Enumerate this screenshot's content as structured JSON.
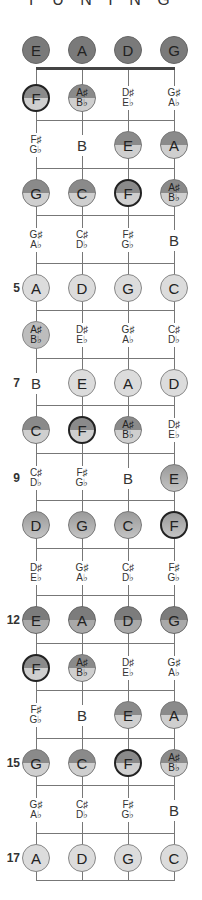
{
  "title": "T U N I N G",
  "strings_x": [
    36,
    82,
    128,
    174
  ],
  "row_y0": 50,
  "row_spacing": 47.5,
  "colors": {
    "string": "#777777",
    "nut": "#444444",
    "open": "#7a7a7a",
    "light": "#dcdcdc"
  },
  "fret_numbers": [
    {
      "fret": 5,
      "label": "5"
    },
    {
      "fret": 7,
      "label": "7"
    },
    {
      "fret": 9,
      "label": "9"
    },
    {
      "fret": 12,
      "label": "12"
    },
    {
      "fret": 15,
      "label": "15"
    },
    {
      "fret": 17,
      "label": "17"
    }
  ],
  "rows": [
    {
      "fret": 0,
      "notes": [
        {
          "n": "E",
          "style": "open"
        },
        {
          "n": "A",
          "style": "open"
        },
        {
          "n": "D",
          "style": "open"
        },
        {
          "n": "G",
          "style": "open"
        }
      ]
    },
    {
      "fret": 1,
      "notes": [
        {
          "n": "F",
          "style": "half f"
        },
        {
          "n": "A♯|B♭",
          "style": "half"
        },
        {
          "n": "D♯|E♭",
          "style": "plain"
        },
        {
          "n": "G♯|A♭",
          "style": "plain"
        }
      ]
    },
    {
      "fret": 2,
      "notes": [
        {
          "n": "F♯|G♭",
          "style": "plain"
        },
        {
          "n": "B",
          "style": "plain"
        },
        {
          "n": "E",
          "style": "half"
        },
        {
          "n": "A",
          "style": "half"
        }
      ]
    },
    {
      "fret": 3,
      "notes": [
        {
          "n": "G",
          "style": "half"
        },
        {
          "n": "C",
          "style": "half"
        },
        {
          "n": "F",
          "style": "half f"
        },
        {
          "n": "A♯|B♭",
          "style": "half"
        }
      ]
    },
    {
      "fret": 4,
      "notes": [
        {
          "n": "G♯|A♭",
          "style": "plain"
        },
        {
          "n": "C♯|D♭",
          "style": "plain"
        },
        {
          "n": "F♯|G♭",
          "style": "plain"
        },
        {
          "n": "B",
          "style": "plain"
        }
      ]
    },
    {
      "fret": 5,
      "notes": [
        {
          "n": "A",
          "style": "light"
        },
        {
          "n": "D",
          "style": "light"
        },
        {
          "n": "G",
          "style": "light"
        },
        {
          "n": "C",
          "style": "light"
        }
      ]
    },
    {
      "fret": 6,
      "notes": [
        {
          "n": "A♯|B♭",
          "style": "mid"
        },
        {
          "n": "D♯|E♭",
          "style": "plain"
        },
        {
          "n": "G♯|A♭",
          "style": "plain"
        },
        {
          "n": "C♯|D♭",
          "style": "plain"
        }
      ]
    },
    {
      "fret": 7,
      "notes": [
        {
          "n": "B",
          "style": "plain"
        },
        {
          "n": "E",
          "style": "light"
        },
        {
          "n": "A",
          "style": "light"
        },
        {
          "n": "D",
          "style": "light"
        }
      ]
    },
    {
      "fret": 8,
      "notes": [
        {
          "n": "C",
          "style": "half"
        },
        {
          "n": "F",
          "style": "half f"
        },
        {
          "n": "A♯|B♭",
          "style": "half"
        },
        {
          "n": "D♯|E♭",
          "style": "plain"
        }
      ]
    },
    {
      "fret": 9,
      "notes": [
        {
          "n": "C♯|D♭",
          "style": "plain"
        },
        {
          "n": "F♯|G♭",
          "style": "plain"
        },
        {
          "n": "B",
          "style": "plain"
        },
        {
          "n": "E",
          "style": "grad"
        }
      ]
    },
    {
      "fret": 10,
      "notes": [
        {
          "n": "D",
          "style": "grad"
        },
        {
          "n": "G",
          "style": "grad"
        },
        {
          "n": "C",
          "style": "grad"
        },
        {
          "n": "F",
          "style": "grad f"
        }
      ]
    },
    {
      "fret": 11,
      "notes": [
        {
          "n": "D♯|E♭",
          "style": "plain"
        },
        {
          "n": "G♯|A♭",
          "style": "plain"
        },
        {
          "n": "C♯|D♭",
          "style": "plain"
        },
        {
          "n": "F♯|G♭",
          "style": "plain"
        }
      ]
    },
    {
      "fret": 12,
      "notes": [
        {
          "n": "E",
          "style": "halfdark"
        },
        {
          "n": "A",
          "style": "halfdark"
        },
        {
          "n": "D",
          "style": "halfdark"
        },
        {
          "n": "G",
          "style": "halfdark"
        }
      ]
    },
    {
      "fret": 13,
      "notes": [
        {
          "n": "F",
          "style": "half f"
        },
        {
          "n": "A♯|B♭",
          "style": "half"
        },
        {
          "n": "D♯|E♭",
          "style": "plain"
        },
        {
          "n": "G♯|A♭",
          "style": "plain"
        }
      ]
    },
    {
      "fret": 14,
      "notes": [
        {
          "n": "F♯|G♭",
          "style": "plain"
        },
        {
          "n": "B",
          "style": "plain"
        },
        {
          "n": "E",
          "style": "half"
        },
        {
          "n": "A",
          "style": "half"
        }
      ]
    },
    {
      "fret": 15,
      "notes": [
        {
          "n": "G",
          "style": "half"
        },
        {
          "n": "C",
          "style": "half"
        },
        {
          "n": "F",
          "style": "half f"
        },
        {
          "n": "A♯|B♭",
          "style": "half"
        }
      ]
    },
    {
      "fret": 16,
      "notes": [
        {
          "n": "G♯|A♭",
          "style": "plain"
        },
        {
          "n": "C♯|D♭",
          "style": "plain"
        },
        {
          "n": "F♯|G♭",
          "style": "plain"
        },
        {
          "n": "B",
          "style": "plain"
        }
      ]
    },
    {
      "fret": 17,
      "notes": [
        {
          "n": "A",
          "style": "light"
        },
        {
          "n": "D",
          "style": "light"
        },
        {
          "n": "G",
          "style": "light"
        },
        {
          "n": "C",
          "style": "light"
        }
      ]
    }
  ]
}
